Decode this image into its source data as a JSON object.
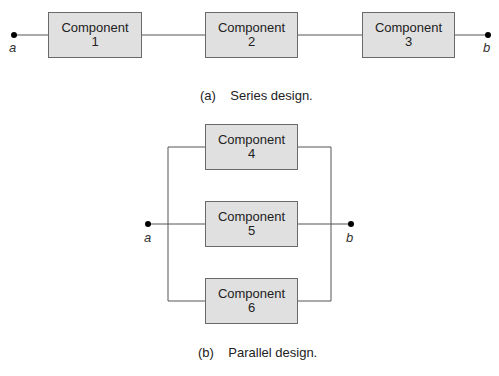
{
  "series": {
    "components": [
      {
        "label": "Component",
        "number": "1"
      },
      {
        "label": "Component",
        "number": "2"
      },
      {
        "label": "Component",
        "number": "3"
      }
    ],
    "terminal_a": "a",
    "terminal_b": "b",
    "caption_tag": "(a)",
    "caption_text": "Series design."
  },
  "parallel": {
    "components": [
      {
        "label": "Component",
        "number": "4"
      },
      {
        "label": "Component",
        "number": "5"
      },
      {
        "label": "Component",
        "number": "6"
      }
    ],
    "terminal_a": "a",
    "terminal_b": "b",
    "caption_tag": "(b)",
    "caption_text": "Parallel design."
  },
  "colors": {
    "box_fill": "#e0e0e0",
    "box_border": "#6a6a6a",
    "wire": "#555555",
    "terminal_dot": "#000000"
  }
}
